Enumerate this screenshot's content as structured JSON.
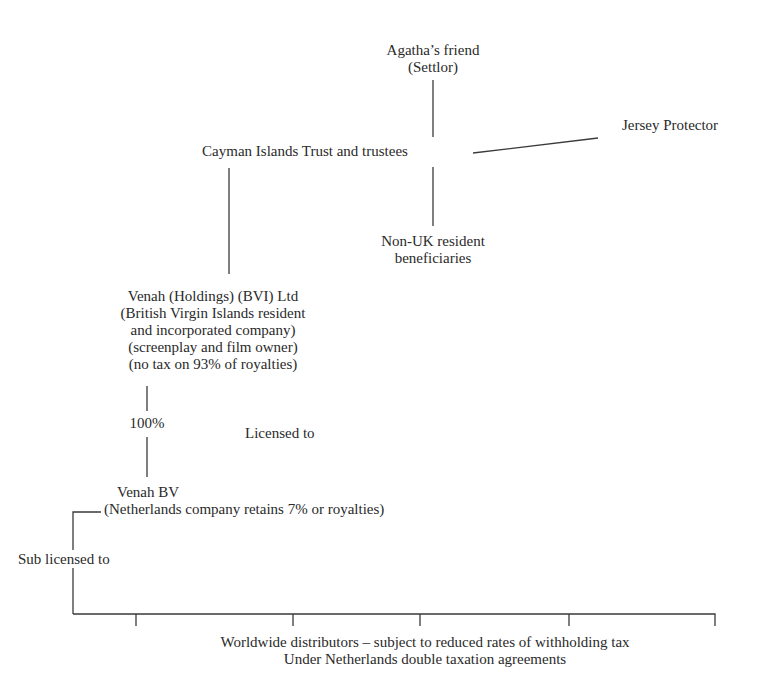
{
  "nodes": {
    "settlor": {
      "lines": [
        "Agatha’s friend",
        "(Settlor)"
      ]
    },
    "trust": {
      "label": "Cayman Islands Trust and trustees"
    },
    "protector": {
      "label": "Jersey Protector"
    },
    "beneficiaries": {
      "lines": [
        "Non-UK resident",
        "beneficiaries"
      ]
    },
    "holdings": {
      "lines": [
        "Venah (Holdings) (BVI) Ltd",
        "(British Virgin Islands resident",
        "and incorporated company)",
        "(screenplay and film owner)",
        "(no tax on 93% of royalties)"
      ]
    },
    "bv": {
      "lines": [
        "Venah BV",
        "(Netherlands company retains 7% or royalties)"
      ]
    },
    "distributors": {
      "lines": [
        "Worldwide distributors – subject to reduced rates of withholding tax",
        "Under Netherlands double taxation agreements"
      ]
    }
  },
  "edges": {
    "ownership": "100%",
    "licensed": "Licensed to",
    "sublicensed": "Sub licensed to"
  }
}
